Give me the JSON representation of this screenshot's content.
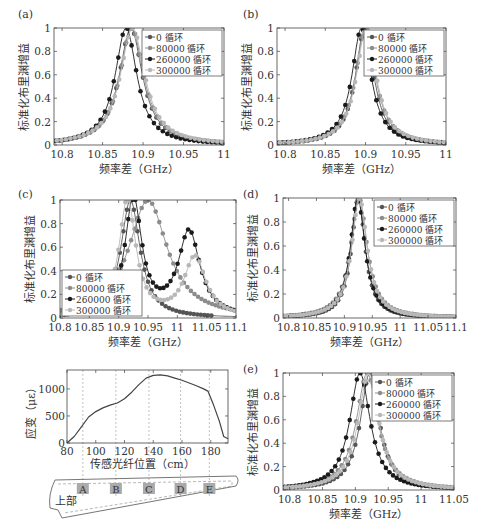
{
  "figure": {
    "panel_labels": [
      "(a)",
      "(b)",
      "(c)",
      "(d)",
      "(e)"
    ],
    "y_label": "标准化布里渊增益",
    "x_label": "频率差（GHz）",
    "legend": [
      "0 循环",
      "80000 循环",
      "260000 循环",
      "300000 循环"
    ],
    "series_colors": [
      "#555555",
      "#8c8c8c",
      "#1a1a1a",
      "#b8b8b8"
    ]
  },
  "strain": {
    "y_label": "应变（με）",
    "x_label": "传感光纤位置（cm）",
    "x_ticks": [
      "80",
      "100",
      "120",
      "140",
      "160",
      "180"
    ],
    "y_ticks": [
      "0",
      "500",
      "1000"
    ],
    "marker_labels": [
      "A",
      "B",
      "C",
      "D",
      "E"
    ],
    "upper_label": "上部"
  },
  "chart_data": [
    {
      "panel": "(a)",
      "type": "line",
      "xlabel": "频率差（GHz）",
      "ylabel": "标准化布里渊增益",
      "xlim": [
        10.79,
        11.0
      ],
      "ylim": [
        0,
        1
      ],
      "x_ticks": [
        "10.8",
        "10.85",
        "10.9",
        "10.95",
        "11"
      ],
      "y_ticks": [
        "0",
        "0.2",
        "0.4",
        "0.6",
        "0.8",
        "1"
      ],
      "legend_position": "upper right",
      "series": [
        {
          "name": "0 循环",
          "peak_x": 10.885,
          "fwhm": 0.035
        },
        {
          "name": "80000 循环",
          "peak_x": 10.886,
          "fwhm": 0.036
        },
        {
          "name": "260000 循环",
          "peak_x": 10.879,
          "fwhm": 0.033
        },
        {
          "name": "300000 循环",
          "peak_x": 10.887,
          "fwhm": 0.037
        }
      ]
    },
    {
      "panel": "(b)",
      "type": "line",
      "xlabel": "频率差（GHz）",
      "ylabel": "标准化布里渊增益",
      "xlim": [
        10.79,
        11.0
      ],
      "ylim": [
        0,
        1
      ],
      "x_ticks": [
        "10.8",
        "10.85",
        "10.9",
        "10.95",
        "11"
      ],
      "y_ticks": [
        "0",
        "0.2",
        "0.4",
        "0.6",
        "0.8",
        "1"
      ],
      "legend_position": "upper right",
      "series": [
        {
          "name": "0 循环",
          "peak_x": 10.899,
          "fwhm": 0.028
        },
        {
          "name": "80000 循环",
          "peak_x": 10.9,
          "fwhm": 0.03
        },
        {
          "name": "260000 循环",
          "peak_x": 10.895,
          "fwhm": 0.029
        },
        {
          "name": "300000 循环",
          "peak_x": 10.901,
          "fwhm": 0.03
        }
      ]
    },
    {
      "panel": "(c)",
      "type": "line",
      "xlabel": "频率差（GHz）",
      "ylabel": "标准化布里渊增益",
      "xlim": [
        10.8,
        11.1
      ],
      "ylim": [
        0,
        1
      ],
      "x_ticks": [
        "10.8",
        "10.85",
        "10.9",
        "10.95",
        "11",
        "11.05",
        "11.1"
      ],
      "y_ticks": [
        "0",
        "0.2",
        "0.4",
        "0.6",
        "0.8",
        "1"
      ],
      "legend_position": "lower left",
      "series": [
        {
          "name": "0 循环",
          "peak_x": 10.92,
          "fwhm": 0.04,
          "second_peak": null
        },
        {
          "name": "80000 循环",
          "peak_x": 10.95,
          "fwhm": 0.08,
          "second_peak": null
        },
        {
          "name": "260000 循环",
          "peak_x": 10.925,
          "fwhm": 0.035,
          "second_peak": {
            "x": 11.02,
            "y": 0.72
          },
          "valley": {
            "x": 10.97,
            "y": 0.37
          }
        },
        {
          "name": "300000 循环",
          "peak_x": 10.915,
          "fwhm": 0.035,
          "second_peak": {
            "x": 11.03,
            "y": 0.51
          },
          "valley": {
            "x": 10.965,
            "y": 0.24
          }
        }
      ]
    },
    {
      "panel": "(d)",
      "type": "line",
      "xlabel": "频率差（GHz）",
      "ylabel": "标准化布里渊增益",
      "xlim": [
        10.79,
        11.1
      ],
      "ylim": [
        0,
        1
      ],
      "x_ticks": [
        "10.8",
        "10.85",
        "10.9",
        "10.95",
        "11",
        "11.05",
        "11.1"
      ],
      "y_ticks": [
        "0",
        "0.2",
        "0.4",
        "0.6",
        "0.8",
        "1"
      ],
      "legend_position": "upper right",
      "series": [
        {
          "name": "0 循环",
          "peak_x": 10.925,
          "fwhm": 0.03
        },
        {
          "name": "80000 循环",
          "peak_x": 10.926,
          "fwhm": 0.036
        },
        {
          "name": "260000 循环",
          "peak_x": 10.924,
          "fwhm": 0.032
        },
        {
          "name": "300000 循环",
          "peak_x": 10.927,
          "fwhm": 0.034
        }
      ]
    },
    {
      "panel": "(e)",
      "type": "line",
      "xlabel": "频率差（GHz）",
      "ylabel": "标准化布里渊增益",
      "xlim": [
        10.79,
        11.05
      ],
      "ylim": [
        0,
        1
      ],
      "x_ticks": [
        "10.8",
        "10.85",
        "10.9",
        "10.95",
        "11",
        "11.05"
      ],
      "y_ticks": [
        "0",
        "0.2",
        "0.4",
        "0.6",
        "0.8",
        "1"
      ],
      "legend_position": "upper right",
      "series": [
        {
          "name": "0 循环",
          "peak_x": 10.922,
          "fwhm": 0.035
        },
        {
          "name": "80000 循环",
          "peak_x": 10.918,
          "fwhm": 0.04
        },
        {
          "name": "260000 循环",
          "peak_x": 10.907,
          "fwhm": 0.038
        },
        {
          "name": "300000 循环",
          "peak_x": 10.92,
          "fwhm": 0.038
        }
      ]
    },
    {
      "panel": "strain",
      "type": "line",
      "xlabel": "传感光纤位置（cm）",
      "ylabel": "应变（με）",
      "xlim": [
        80,
        192
      ],
      "ylim": [
        0,
        1350
      ],
      "x": [
        80,
        85,
        90,
        95,
        100,
        105,
        110,
        115,
        120,
        125,
        130,
        135,
        140,
        145,
        150,
        155,
        160,
        165,
        170,
        175,
        178,
        182,
        186,
        189,
        192
      ],
      "values": [
        0,
        120,
        300,
        480,
        580,
        650,
        700,
        740,
        820,
        940,
        1080,
        1200,
        1250,
        1260,
        1240,
        1200,
        1160,
        1110,
        1060,
        1000,
        960,
        700,
        400,
        120,
        80
      ],
      "vertical_markers": [
        {
          "label": "A",
          "x": 91
        },
        {
          "label": "B",
          "x": 114
        },
        {
          "label": "C",
          "x": 137
        },
        {
          "label": "D",
          "x": 159
        },
        {
          "label": "E",
          "x": 179
        }
      ]
    }
  ]
}
